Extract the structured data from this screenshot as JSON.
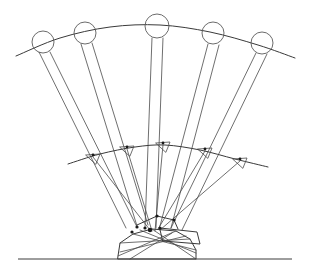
{
  "figure": {
    "canvas": {
      "width": 310,
      "height": 274
    },
    "colors": {
      "background": "#ffffff",
      "line": "#4a4a4a",
      "line_dark": "#222222",
      "ground": "#3d3d3d",
      "circle": "#5a5a5a",
      "joint": "#1a1a1a"
    }
  },
  "chart_data": {
    "type": "line",
    "xlabel": "",
    "ylabel": "",
    "xlim": [
      0,
      310
    ],
    "ylim": [
      274,
      0
    ],
    "grid": false,
    "legend": null,
    "annotations": [],
    "upper_arc": {
      "name": "end-effector trace arc",
      "points": [
        [
          16,
          56
        ],
        [
          60,
          38
        ],
        [
          110,
          27
        ],
        [
          160,
          25
        ],
        [
          210,
          32
        ],
        [
          258,
          45
        ],
        [
          295,
          58
        ]
      ]
    },
    "lower_arc": {
      "name": "intermediate joint trace arc",
      "points": [
        [
          68,
          164
        ],
        [
          100,
          154
        ],
        [
          135,
          147
        ],
        [
          165,
          145
        ],
        [
          200,
          150
        ],
        [
          235,
          159
        ],
        [
          268,
          167
        ]
      ]
    },
    "ground_line": {
      "name": "ground reference line",
      "points": [
        [
          18,
          259
        ],
        [
          292,
          259
        ]
      ]
    },
    "pivot": {
      "x": 150,
      "y": 230
    },
    "positions": [
      {
        "index": 1,
        "label": "position-1",
        "circle": {
          "cx": 43,
          "cy": 42,
          "r": 11
        },
        "mid_joint": {
          "x": 93,
          "y": 157
        },
        "mast": [
          [
            39,
            52
          ],
          [
            126,
            228
          ],
          [
            50,
            52
          ],
          [
            137,
            227
          ]
        ],
        "lower_link": [
          [
            93,
            157
          ],
          [
            150,
            230
          ]
        ]
      },
      {
        "index": 2,
        "label": "position-2",
        "circle": {
          "cx": 85,
          "cy": 33,
          "r": 11
        },
        "mid_joint": {
          "x": 127,
          "y": 149
        },
        "mast": [
          [
            81,
            44
          ],
          [
            137,
            226
          ],
          [
            92,
            43
          ],
          [
            148,
            225
          ]
        ],
        "lower_link": [
          [
            127,
            149
          ],
          [
            152,
            231
          ]
        ]
      },
      {
        "index": 3,
        "label": "position-3",
        "circle": {
          "cx": 157,
          "cy": 26,
          "r": 12
        },
        "mid_joint": {
          "x": 163,
          "y": 145
        },
        "mast": [
          [
            152,
            38
          ],
          [
            145,
            228
          ],
          [
            163,
            38
          ],
          [
            156,
            228
          ]
        ],
        "lower_link": [
          [
            163,
            145
          ],
          [
            155,
            231
          ]
        ]
      },
      {
        "index": 4,
        "label": "position-4",
        "circle": {
          "cx": 213,
          "cy": 33,
          "r": 11
        },
        "mid_joint": {
          "x": 205,
          "y": 151
        },
        "mast": [
          [
            208,
            44
          ],
          [
            160,
            226
          ],
          [
            219,
            45
          ],
          [
            171,
            228
          ]
        ],
        "lower_link": [
          [
            205,
            151
          ],
          [
            158,
            229
          ]
        ]
      },
      {
        "index": 5,
        "label": "position-5",
        "circle": {
          "cx": 262,
          "cy": 43,
          "r": 11
        },
        "mid_joint": {
          "x": 240,
          "y": 161
        },
        "mast": [
          [
            256,
            53
          ],
          [
            171,
            228
          ],
          [
            267,
            54
          ],
          [
            182,
            230
          ]
        ],
        "lower_link": [
          [
            240,
            161
          ],
          [
            160,
            230
          ]
        ]
      }
    ],
    "base_body": {
      "name": "machine base and chassis",
      "outline": [
        [
          118,
          256
        ],
        [
          120,
          243
        ],
        [
          133,
          234
        ],
        [
          152,
          229
        ],
        [
          176,
          231
        ],
        [
          190,
          239
        ],
        [
          196,
          250
        ],
        [
          196,
          259
        ],
        [
          118,
          259
        ]
      ],
      "internal_links": [
        [
          [
            120,
            243
          ],
          [
            190,
            239
          ]
        ],
        [
          [
            133,
            234
          ],
          [
            196,
            250
          ]
        ],
        [
          [
            118,
            256
          ],
          [
            176,
            231
          ]
        ],
        [
          [
            152,
            229
          ],
          [
            196,
            259
          ]
        ],
        [
          [
            120,
            252
          ],
          [
            186,
            236
          ]
        ],
        [
          [
            130,
            259
          ],
          [
            172,
            233
          ]
        ],
        [
          [
            140,
            230
          ],
          [
            196,
            253
          ]
        ]
      ],
      "boom_plate": [
        [
          160,
          228
        ],
        [
          197,
          232
        ],
        [
          200,
          244
        ],
        [
          163,
          241
        ]
      ],
      "upper_arm": [
        [
          137,
          225
        ],
        [
          157,
          216
        ],
        [
          174,
          220
        ],
        [
          178,
          229
        ]
      ]
    },
    "joints": [
      {
        "x": 150,
        "y": 230
      },
      {
        "x": 137,
        "y": 227
      },
      {
        "x": 145,
        "y": 228
      },
      {
        "x": 157,
        "y": 216
      },
      {
        "x": 174,
        "y": 220
      },
      {
        "x": 132,
        "y": 232
      },
      {
        "x": 160,
        "y": 228
      }
    ]
  }
}
